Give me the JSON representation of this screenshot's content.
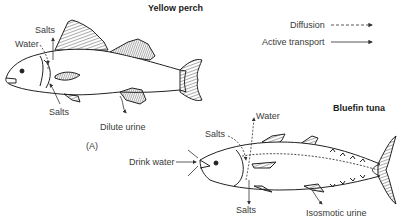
{
  "figure": {
    "panel_label": "(A)",
    "legend": {
      "items": [
        {
          "label": "Diffusion",
          "style": "dashed"
        },
        {
          "label": "Active transport",
          "style": "solid"
        }
      ]
    },
    "fish": [
      {
        "name": "Yellow perch",
        "labels": {
          "salts_top": "Salts",
          "water": "Water",
          "salts_bottom": "Salts",
          "urine": "Dilute urine"
        }
      },
      {
        "name": "Bluefin tuna",
        "labels": {
          "water": "Water",
          "salts_top": "Salts",
          "drink": "Drink water",
          "salts_bottom": "Salts",
          "urine": "Isosmotic urine"
        }
      }
    ]
  }
}
